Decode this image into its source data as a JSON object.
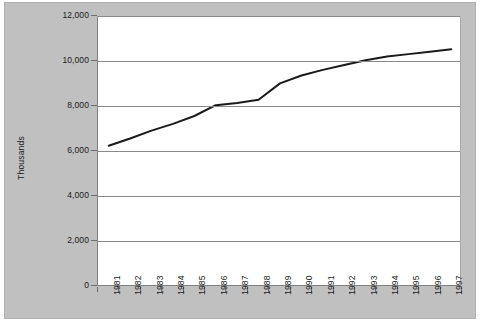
{
  "chart_data": {
    "type": "line",
    "title": "",
    "subtitle": "",
    "xlabel": "",
    "ylabel": "Thousands",
    "categories": [
      "1981",
      "1982",
      "1983",
      "1984",
      "1985",
      "1986",
      "1987",
      "1988",
      "1989",
      "1990",
      "1991",
      "1992",
      "1993",
      "1994",
      "1995",
      "1996",
      "1997"
    ],
    "series": [
      {
        "name": "",
        "color": "#1a1a1a",
        "values": [
          6280,
          6600,
          6950,
          7250,
          7600,
          8080,
          8180,
          8320,
          9050,
          9400,
          9650,
          9870,
          10080,
          10240,
          10350,
          10460,
          10570
        ]
      }
    ],
    "ylim": [
      0,
      12000
    ],
    "ytick_values": [
      12000,
      10000,
      8000,
      6000,
      4000,
      2000,
      0
    ],
    "ytick_labels": [
      "12,000",
      "10,000",
      "8,000",
      "6,000",
      "4,000",
      "2,000",
      "0"
    ],
    "grid": true,
    "grid_axis": "y",
    "legend": false,
    "legend_position": "none",
    "markers": false,
    "line_width": 2
  },
  "colors": {
    "chart_background": "#c0c0c0",
    "plot_background": "#ffffff",
    "gridline": "#8a8a8a",
    "axis": "#6e6e6e",
    "text": "#1a1a1a",
    "series": "#1a1a1a",
    "page_background": "#ffffff"
  }
}
